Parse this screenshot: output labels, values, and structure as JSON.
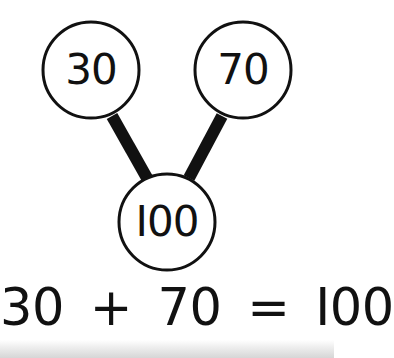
{
  "diagram": {
    "type": "number-bond",
    "parts": [
      {
        "id": "part-left",
        "label": "30",
        "cx": 91,
        "cy": 70
      },
      {
        "id": "part-right",
        "label": "70",
        "cx": 243,
        "cy": 70
      }
    ],
    "whole": {
      "id": "whole",
      "label": "I00",
      "cx": 167,
      "cy": 222
    },
    "node_radius": 48,
    "stroke_color": "#111111",
    "fill_color": "#ffffff",
    "connectors": [
      {
        "from": "part-left",
        "to": "whole",
        "x1": 112,
        "y1": 116,
        "x2": 147,
        "y2": 178
      },
      {
        "from": "part-right",
        "to": "whole",
        "x1": 222,
        "y1": 116,
        "x2": 189,
        "y2": 178
      }
    ]
  },
  "equation": {
    "left_operand": "30",
    "operator": "+",
    "right_operand": "70",
    "equals": "=",
    "result": "I00"
  }
}
